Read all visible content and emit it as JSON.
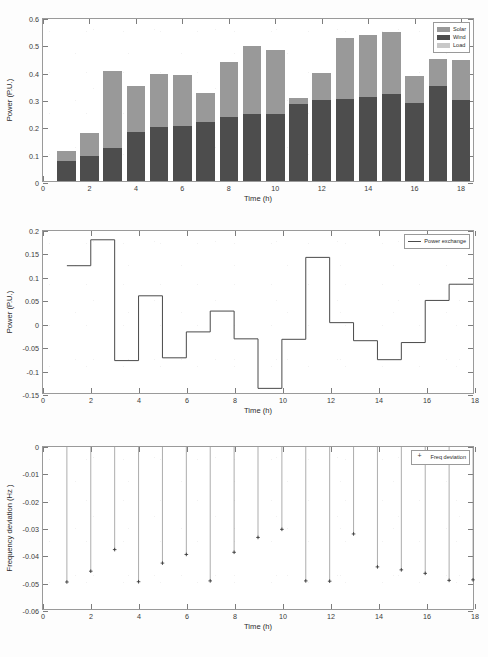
{
  "figure": {
    "background_color": "#fdfdfd",
    "axis_color": "#9a9a9a",
    "grid_color": "#d8d8d8"
  },
  "colors": {
    "solar": "#999999",
    "wind": "#4d4d4d",
    "load": "#c8c8c8",
    "power_exchange_line": "#4a4a4a",
    "freq_marker": "#3a3a3a"
  },
  "chart_data": [
    {
      "id": "bar-chart",
      "type": "bar",
      "stacked": true,
      "title": "",
      "xlabel": "Time (h)",
      "ylabel": "Power (P.U.)",
      "xlim": [
        0,
        18.6
      ],
      "ylim": [
        0,
        0.6
      ],
      "yticks": [
        0,
        0.1,
        0.2,
        0.3,
        0.4,
        0.5,
        0.6
      ],
      "ytick_labels": [
        "0",
        "0.1",
        "0.2",
        "0.3",
        "0.4",
        "0.5",
        "0.6"
      ],
      "xticks": [
        0,
        2,
        4,
        6,
        8,
        10,
        12,
        14,
        16,
        18
      ],
      "xtick_labels": [
        "0",
        "2",
        "4",
        "6",
        "8",
        "10",
        "12",
        "14",
        "16",
        "18"
      ],
      "grid": false,
      "legend_position": "upper right",
      "categories": [
        1,
        2,
        3,
        4,
        5,
        6,
        7,
        8,
        9,
        10,
        11,
        12,
        13,
        14,
        15,
        16,
        17,
        18
      ],
      "series": [
        {
          "name": "Wind",
          "color": "#4d4d4d",
          "values": [
            0.075,
            0.09,
            0.12,
            0.181,
            0.196,
            0.202,
            0.217,
            0.233,
            0.244,
            0.245,
            0.283,
            0.295,
            0.301,
            0.308,
            0.317,
            0.287,
            0.347,
            0.298
          ]
        },
        {
          "name": "Solar",
          "color": "#999999",
          "values": [
            0.036,
            0.086,
            0.281,
            0.166,
            0.196,
            0.186,
            0.106,
            0.202,
            0.251,
            0.234,
            0.022,
            0.1,
            0.222,
            0.226,
            0.228,
            0.099,
            0.099,
            0.144
          ]
        }
      ],
      "totals": [
        0.111,
        0.176,
        0.401,
        0.347,
        0.392,
        0.388,
        0.323,
        0.435,
        0.495,
        0.479,
        0.305,
        0.395,
        0.523,
        0.534,
        0.545,
        0.386,
        0.446,
        0.442
      ],
      "legend": [
        {
          "label": "Solar",
          "color": "#999999",
          "marker": "patch"
        },
        {
          "label": "Wind",
          "color": "#4d4d4d",
          "marker": "patch"
        },
        {
          "label": "Load",
          "color": "#c8c8c8",
          "marker": "patch"
        }
      ]
    },
    {
      "id": "step-chart",
      "type": "line",
      "step": true,
      "title": "",
      "xlabel": "Time (h)",
      "ylabel": "Power (P.U.)",
      "xlim": [
        0,
        18
      ],
      "ylim": [
        -0.15,
        0.2
      ],
      "yticks": [
        -0.15,
        -0.1,
        -0.05,
        0,
        0.05,
        0.1,
        0.15,
        0.2
      ],
      "ytick_labels": [
        "-0.15",
        "-0.1",
        "-0.05",
        "0",
        "0.05",
        "0.1",
        "0.15",
        "0.2"
      ],
      "xticks": [
        0,
        2,
        4,
        6,
        8,
        10,
        12,
        14,
        16,
        18
      ],
      "xtick_labels": [
        "0",
        "2",
        "4",
        "6",
        "8",
        "10",
        "12",
        "14",
        "16",
        "18"
      ],
      "grid": false,
      "legend_position": "upper right",
      "x": [
        1,
        2,
        3,
        4,
        5,
        6,
        7,
        8,
        9,
        10,
        11,
        12,
        13,
        14,
        15,
        16,
        17,
        18
      ],
      "series": [
        {
          "name": "Power exchange",
          "color": "#4a4a4a",
          "values": [
            0.125,
            0.181,
            -0.08,
            0.06,
            -0.074,
            -0.018,
            0.027,
            -0.033,
            -0.14,
            -0.034,
            0.143,
            0.002,
            -0.037,
            -0.078,
            -0.041,
            0.05,
            0.085,
            0.085
          ]
        }
      ],
      "legend": [
        {
          "label": "Power exchange",
          "color": "#4a4a4a",
          "marker": "line"
        }
      ]
    },
    {
      "id": "stem-chart",
      "type": "scatter",
      "stem": true,
      "title": "",
      "xlabel": "Time (h)",
      "ylabel": "Frequency deviation (Hz )",
      "xlim": [
        0,
        18
      ],
      "ylim": [
        -0.06,
        0
      ],
      "yticks": [
        -0.06,
        -0.05,
        -0.04,
        -0.03,
        -0.02,
        -0.01,
        0
      ],
      "ytick_labels": [
        "-0.06",
        "-0.05",
        "-0.04",
        "-0.03",
        "-0.02",
        "-0.01",
        "0"
      ],
      "xticks": [
        0,
        2,
        4,
        6,
        8,
        10,
        12,
        14,
        16,
        18
      ],
      "xtick_labels": [
        "0",
        "2",
        "4",
        "6",
        "8",
        "10",
        "12",
        "14",
        "16",
        "18"
      ],
      "grid": false,
      "legend_position": "upper right",
      "x": [
        1,
        2,
        3,
        4,
        5,
        6,
        7,
        8,
        9,
        10,
        11,
        12,
        13,
        14,
        15,
        16,
        17,
        18
      ],
      "series": [
        {
          "name": "Freq deviation",
          "color": "#3a3a3a",
          "values": [
            -0.05,
            -0.046,
            -0.038,
            -0.0499,
            -0.043,
            -0.0398,
            -0.0496,
            -0.039,
            -0.0335,
            -0.0305,
            -0.0496,
            -0.0497,
            -0.0322,
            -0.0444,
            -0.0455,
            -0.0468,
            -0.0494,
            -0.0492
          ]
        }
      ],
      "legend": [
        {
          "label": "Freq deviation",
          "color": "#3a3a3a",
          "marker": "plus"
        }
      ]
    }
  ]
}
